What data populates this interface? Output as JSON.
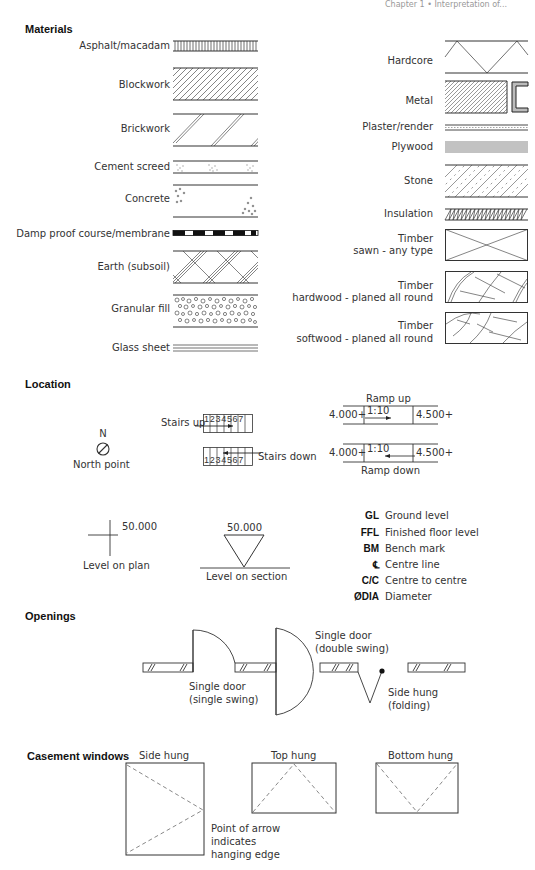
{
  "header": {
    "running_head": "Chapter 1 • Interpretation of..."
  },
  "sections": {
    "materials": {
      "title": "Materials",
      "left": [
        {
          "label": "Asphalt/macadam",
          "symbol": "vertical-hatch"
        },
        {
          "label": "Blockwork",
          "symbol": "diagonal-hatch-dense"
        },
        {
          "label": "Brickwork",
          "symbol": "diagonal-double-lines"
        },
        {
          "label": "Cement screed",
          "symbol": "stipple-band"
        },
        {
          "label": "Concrete",
          "symbol": "aggregate-corners"
        },
        {
          "label": "Damp proof course/membrane",
          "symbol": "dashed-thick-line"
        },
        {
          "label": "Earth (subsoil)",
          "symbol": "crossed-triple-lines"
        },
        {
          "label": "Granular fill",
          "symbol": "pebbles"
        },
        {
          "label": "Glass sheet",
          "symbol": "triple-thin-lines"
        }
      ],
      "right": [
        {
          "label": "Hardcore",
          "symbol": "zigzag"
        },
        {
          "label": "Metal",
          "symbol": "diagonal-hatch-with-channel"
        },
        {
          "label": "Plaster/render",
          "symbol": "dotted-band"
        },
        {
          "label": "Plywood",
          "symbol": "multi-lines"
        },
        {
          "label": "Stone",
          "symbol": "diagonal-dash-hatch"
        },
        {
          "label": "Insulation",
          "symbol": "zigzag-hatch"
        },
        {
          "label": "Timber",
          "sublabel": "sawn - any type",
          "symbol": "box-cross"
        },
        {
          "label": "Timber",
          "sublabel": "hardwood - planed all round",
          "symbol": "box-grain"
        },
        {
          "label": "Timber",
          "sublabel": "softwood - planed all round",
          "symbol": "box-grain-soft"
        }
      ]
    },
    "location": {
      "title": "Location",
      "north": {
        "letter": "N",
        "label": "North point"
      },
      "stairs_up": {
        "label": "Stairs up",
        "steps": [
          "1",
          "2",
          "3",
          "4",
          "5",
          "6",
          "7"
        ]
      },
      "stairs_down": {
        "label": "Stairs down",
        "steps": [
          "1",
          "2",
          "3",
          "4",
          "5",
          "6",
          "7"
        ]
      },
      "ramp_up": {
        "title": "Ramp up",
        "start": "4.000+",
        "gradient": "1:10",
        "end": "4.500+"
      },
      "ramp_down": {
        "title": "Ramp down",
        "start": "4.000+",
        "gradient": "1:10",
        "end": "4.500+"
      },
      "level_plan": {
        "value": "50.000",
        "label": "Level on plan"
      },
      "level_section": {
        "value": "50.000",
        "label": "Level on section"
      },
      "abbreviations": [
        {
          "abbr": "GL",
          "meaning": "Ground level"
        },
        {
          "abbr": "FFL",
          "meaning": "Finished floor level"
        },
        {
          "abbr": "BM",
          "meaning": "Bench mark"
        },
        {
          "abbr": "℄",
          "meaning": "Centre line"
        },
        {
          "abbr": "C/C",
          "meaning": "Centre to centre"
        },
        {
          "abbr": "ØDIA",
          "meaning": "Diameter"
        }
      ]
    },
    "openings": {
      "title": "Openings",
      "single_swing": {
        "line1": "Single door",
        "line2": "(single swing)"
      },
      "double_swing": {
        "line1": "Single door",
        "line2": "(double swing)"
      },
      "folding": {
        "line1": "Side hung",
        "line2": "(folding)"
      }
    },
    "casement": {
      "title": "Casement windows",
      "side": "Side hung",
      "top": "Top hung",
      "bottom": "Bottom hung",
      "note": [
        "Point of arrow",
        "indicates",
        "hanging edge"
      ]
    }
  }
}
